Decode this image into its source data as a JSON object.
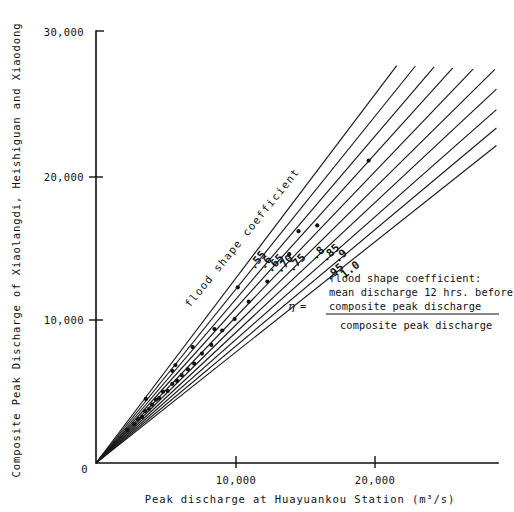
{
  "chart_data": {
    "type": "line",
    "title": "",
    "xlabel": "Peak discharge at Huayuankou Station (m³/s)",
    "ylabel": "Composite Peak Discharge of Xiaolangdi, Heishiguan and Xiaodong",
    "xlim": [
      0,
      25800
    ],
    "ylim": [
      0,
      30000
    ],
    "xticks": [
      0,
      10000,
      20000
    ],
    "xticklabels": [
      "0",
      "10,000",
      "20,000"
    ],
    "yticks": [
      0,
      10000,
      20000,
      30000
    ],
    "yticklabels": [
      "0",
      "10,000",
      "20,000",
      "30,000"
    ],
    "grid": false,
    "legend_position": "center-right",
    "series_caption": "flood shape coefficient",
    "series": [
      {
        "name": ".55",
        "label": ".55",
        "slope": 1.43,
        "x": [
          0,
          19300
        ],
        "values": [
          0,
          27600
        ]
      },
      {
        "name": ".6",
        "label": ".6",
        "slope": 1.345,
        "x": [
          0,
          20500
        ],
        "values": [
          0,
          27570
        ]
      },
      {
        "name": ".65",
        "label": ".65",
        "slope": 1.268,
        "x": [
          0,
          21700
        ],
        "values": [
          0,
          27510
        ]
      },
      {
        "name": ".70",
        "label": ".70",
        "slope": 1.198,
        "x": [
          0,
          22900
        ],
        "values": [
          0,
          27440
        ]
      },
      {
        "name": ".75",
        "label": ".75",
        "slope": 1.13,
        "x": [
          0,
          24200
        ],
        "values": [
          0,
          27350
        ]
      },
      {
        "name": ".8",
        "label": ".8",
        "slope": 1.068,
        "x": [
          0,
          25600
        ],
        "values": [
          0,
          27340
        ]
      },
      {
        "name": ".85",
        "label": ".85",
        "slope": 1.01,
        "x": [
          0,
          25700
        ],
        "values": [
          0,
          25960
        ]
      },
      {
        "name": ".9",
        "label": ".9",
        "slope": 0.955,
        "x": [
          0,
          25700
        ],
        "values": [
          0,
          24540
        ]
      },
      {
        "name": ".95",
        "label": ".95",
        "slope": 0.905,
        "x": [
          0,
          25700
        ],
        "values": [
          0,
          23260
        ]
      },
      {
        "name": "1.0",
        "label": "1.0",
        "slope": 0.858,
        "x": [
          0,
          25700
        ],
        "values": [
          0,
          22050
        ]
      }
    ],
    "scatter_points": {
      "name": "observed events",
      "x": [
        2000,
        2450,
        2700,
        2950,
        3150,
        3400,
        3600,
        3850,
        4050,
        4300,
        4600,
        4900,
        5200,
        5500,
        5900,
        6300,
        6800,
        7400,
        8100,
        8900,
        9800,
        11000,
        12400,
        14200,
        17500,
        4900,
        6200,
        7600,
        3200,
        5100,
        9100,
        13000
      ],
      "y": [
        2300,
        2700,
        3050,
        3200,
        3600,
        3750,
        4050,
        4400,
        4500,
        4950,
        5000,
        5500,
        5700,
        6100,
        6500,
        6900,
        7600,
        8200,
        9200,
        10000,
        11200,
        12600,
        14500,
        16500,
        21000,
        6400,
        8050,
        9300,
        4450,
        6800,
        12200,
        16100
      ]
    },
    "annotation": {
      "title": "flood shape coefficient:",
      "symbol": "η",
      "equals": "=",
      "numerator_line1": "mean discharge 12 hrs. before",
      "numerator_line2": "composite peak discharge",
      "denominator": "composite peak discharge"
    }
  }
}
